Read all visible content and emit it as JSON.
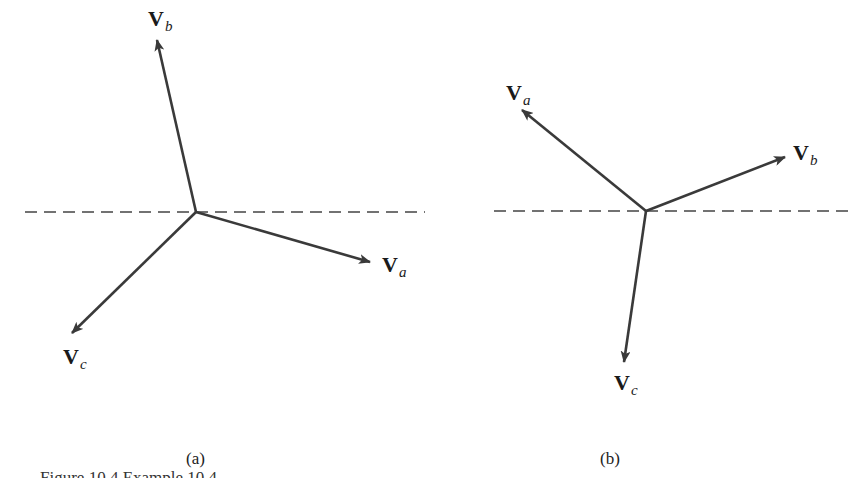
{
  "panels": [
    {
      "caption": "(a)",
      "origin": [
        196,
        212
      ],
      "reference_line": {
        "x1": 25,
        "x2": 425,
        "y": 212,
        "style": "dashed"
      },
      "vectors": [
        {
          "name": "Va",
          "main": "V",
          "sub": "a",
          "tip": [
            370,
            262
          ]
        },
        {
          "name": "Vb",
          "main": "V",
          "sub": "b",
          "tip": [
            157,
            40
          ]
        },
        {
          "name": "Vc",
          "main": "V",
          "sub": "c",
          "tip": [
            72,
            333
          ]
        }
      ]
    },
    {
      "caption": "(b)",
      "origin": [
        646,
        211
      ],
      "reference_line": {
        "x1": 494,
        "x2": 852,
        "y": 211,
        "style": "dashed"
      },
      "vectors": [
        {
          "name": "Va",
          "main": "V",
          "sub": "a",
          "tip": [
            522,
            110
          ]
        },
        {
          "name": "Vb",
          "main": "V",
          "sub": "b",
          "tip": [
            785,
            157
          ]
        },
        {
          "name": "Vc",
          "main": "V",
          "sub": "c",
          "tip": [
            624,
            362
          ]
        }
      ]
    }
  ],
  "figure_caption": "Figure 10.4   Example 10.4",
  "colors": {
    "vector": "#3a3a3a",
    "dashed_line": "#444444",
    "text": "#1a1a1a"
  }
}
